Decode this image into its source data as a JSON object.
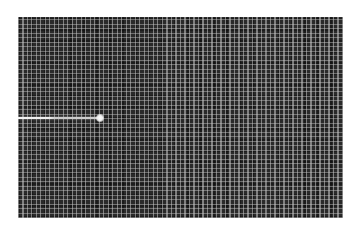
{
  "panel": {
    "background_color": "#2a2a2a",
    "grid_line_color": "#c8c8c8",
    "grid_spacing_px": 4.5
  },
  "trace": {
    "color": "#f0f0f0",
    "start_x": 18,
    "end_x": 100,
    "y": 118
  },
  "trace_dot": {
    "color": "#ffffff",
    "x": 100,
    "y": 118
  }
}
